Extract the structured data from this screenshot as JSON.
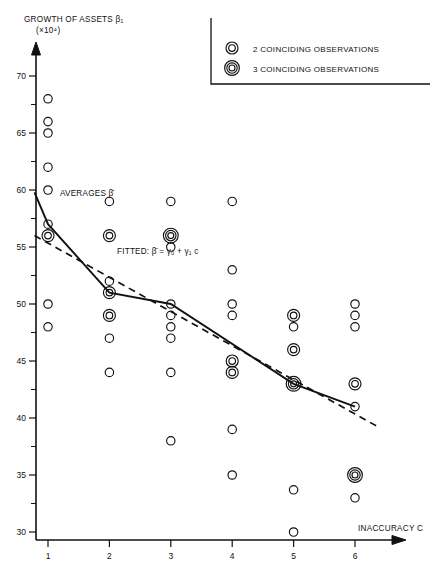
{
  "figure": {
    "y_axis_title": "GROWTH OF ASSETS",
    "y_axis_symbol": "β₁",
    "y_axis_units": "(×10⁴)",
    "x_axis_title": "INACCURACY  C"
  },
  "legend": {
    "items": [
      {
        "marker": "double-circle",
        "label": "2 COINCIDING OBSERVATIONS"
      },
      {
        "marker": "triple-circle",
        "label": "3 COINCIDING OBSERVATIONS"
      }
    ]
  },
  "annotations": [
    {
      "name": "averages-label",
      "text": "AVERAGES β̄"
    },
    {
      "name": "fitted-label",
      "text": "FITTED: β̄ = γ₀ + γ₁ c"
    }
  ],
  "chart_data": {
    "type": "scatter",
    "title": "",
    "xlabel": "INACCURACY C",
    "ylabel": "GROWTH OF ASSETS β₁ (×10⁴)",
    "xlim": [
      0.5,
      6.6
    ],
    "ylim": [
      30,
      71
    ],
    "xticks": [
      1,
      2,
      3,
      4,
      5,
      6
    ],
    "yticks": [
      30,
      35,
      40,
      45,
      50,
      55,
      60,
      65,
      70
    ],
    "y_minor_step": 2.5,
    "grid": false,
    "legend_position": "top-right",
    "points": [
      {
        "x": 1,
        "y": 68.0,
        "count": 1
      },
      {
        "x": 1,
        "y": 66.0,
        "count": 1
      },
      {
        "x": 1,
        "y": 65.0,
        "count": 1
      },
      {
        "x": 1,
        "y": 62.0,
        "count": 1
      },
      {
        "x": 1,
        "y": 60.0,
        "count": 1
      },
      {
        "x": 1,
        "y": 57.0,
        "count": 1
      },
      {
        "x": 1,
        "y": 56.0,
        "count": 2
      },
      {
        "x": 1,
        "y": 50.0,
        "count": 1
      },
      {
        "x": 1,
        "y": 48.0,
        "count": 1
      },
      {
        "x": 2,
        "y": 59.0,
        "count": 1
      },
      {
        "x": 2,
        "y": 56.0,
        "count": 2
      },
      {
        "x": 2,
        "y": 52.0,
        "count": 1
      },
      {
        "x": 2,
        "y": 51.0,
        "count": 2
      },
      {
        "x": 2,
        "y": 49.0,
        "count": 2
      },
      {
        "x": 2,
        "y": 47.0,
        "count": 1
      },
      {
        "x": 2,
        "y": 44.0,
        "count": 1
      },
      {
        "x": 3,
        "y": 59.0,
        "count": 1
      },
      {
        "x": 3,
        "y": 56.0,
        "count": 3
      },
      {
        "x": 3,
        "y": 55.0,
        "count": 1
      },
      {
        "x": 3,
        "y": 50.0,
        "count": 1
      },
      {
        "x": 3,
        "y": 49.0,
        "count": 1
      },
      {
        "x": 3,
        "y": 48.0,
        "count": 1
      },
      {
        "x": 3,
        "y": 47.0,
        "count": 1
      },
      {
        "x": 3,
        "y": 44.0,
        "count": 1
      },
      {
        "x": 3,
        "y": 38.0,
        "count": 1
      },
      {
        "x": 4,
        "y": 59.0,
        "count": 1
      },
      {
        "x": 4,
        "y": 53.0,
        "count": 1
      },
      {
        "x": 4,
        "y": 50.0,
        "count": 1
      },
      {
        "x": 4,
        "y": 49.0,
        "count": 1
      },
      {
        "x": 4,
        "y": 45.0,
        "count": 2
      },
      {
        "x": 4,
        "y": 44.0,
        "count": 2
      },
      {
        "x": 4,
        "y": 39.0,
        "count": 1
      },
      {
        "x": 4,
        "y": 35.0,
        "count": 1
      },
      {
        "x": 5,
        "y": 49.0,
        "count": 2
      },
      {
        "x": 5,
        "y": 48.0,
        "count": 1
      },
      {
        "x": 5,
        "y": 46.0,
        "count": 2
      },
      {
        "x": 5,
        "y": 43.0,
        "count": 3
      },
      {
        "x": 5,
        "y": 33.7,
        "count": 1
      },
      {
        "x": 5,
        "y": 30.0,
        "count": 1
      },
      {
        "x": 6,
        "y": 50.0,
        "count": 1
      },
      {
        "x": 6,
        "y": 49.0,
        "count": 1
      },
      {
        "x": 6,
        "y": 48.0,
        "count": 1
      },
      {
        "x": 6,
        "y": 43.0,
        "count": 2
      },
      {
        "x": 6,
        "y": 41.0,
        "count": 1
      },
      {
        "x": 6,
        "y": 35.0,
        "count": 3
      },
      {
        "x": 6,
        "y": 33.0,
        "count": 1
      }
    ],
    "series": [
      {
        "name": "AVERAGES β̄",
        "type": "line",
        "style": "solid",
        "x": [
          0.78,
          1,
          2,
          3,
          5,
          6
        ],
        "values": [
          59.8,
          57.0,
          51.0,
          50.0,
          43.0,
          41.0
        ]
      },
      {
        "name": "FITTED: β̄ = γ₀ + γ₁ c",
        "type": "line",
        "style": "dashed",
        "x": [
          0.78,
          6.35
        ],
        "values": [
          56.0,
          39.3
        ]
      }
    ]
  }
}
